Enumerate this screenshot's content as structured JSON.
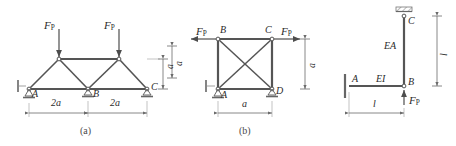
{
  "figure": {
    "caption_a": "(a)",
    "caption_b": "(b)",
    "line_color": "#4d4d4d",
    "member_color": "#555555",
    "dim_color": "#6b6b6b",
    "text_color": "#2b2b2b"
  },
  "fig_a": {
    "name": "two-panel-warren-truss",
    "loads": [
      {
        "label": "F",
        "sub": "P",
        "direction": "down",
        "at": "top-left-node"
      },
      {
        "label": "F",
        "sub": "P",
        "direction": "down",
        "at": "top-right-node"
      }
    ],
    "joints": [
      {
        "id": "A",
        "label": "A",
        "support": "pin"
      },
      {
        "id": "B",
        "label": "B",
        "support": "roller"
      },
      {
        "id": "C",
        "label": "C",
        "support": "roller"
      }
    ],
    "dimensions": [
      {
        "label": "2a",
        "orientation": "horizontal",
        "span": "A-B"
      },
      {
        "label": "2a",
        "orientation": "horizontal",
        "span": "B-C"
      },
      {
        "label": "a",
        "orientation": "vertical",
        "span": "height"
      }
    ]
  },
  "fig_b": {
    "name": "square-truss-with-cross-bracing",
    "loads": [
      {
        "label": "F",
        "sub": "P",
        "direction": "left",
        "at": "B"
      },
      {
        "label": "F",
        "sub": "P",
        "direction": "right",
        "at": "C"
      }
    ],
    "joints": [
      {
        "id": "B",
        "label": "B",
        "support": "none"
      },
      {
        "id": "C",
        "label": "C",
        "support": "none"
      },
      {
        "id": "A",
        "label": "A",
        "support": "pin"
      },
      {
        "id": "D",
        "label": "D",
        "support": "roller"
      }
    ],
    "dimensions": [
      {
        "label": "a",
        "orientation": "horizontal",
        "span": "A-D"
      },
      {
        "label": "a",
        "orientation": "vertical",
        "span": "A-B"
      }
    ]
  },
  "fig_c": {
    "name": "l-shaped-frame",
    "loads": [
      {
        "label": "F",
        "sub": "P",
        "direction": "up",
        "at": "B"
      }
    ],
    "joints": [
      {
        "id": "A",
        "label": "A",
        "support": "fixed"
      },
      {
        "id": "B",
        "label": "B",
        "support": "none"
      },
      {
        "id": "C",
        "label": "C",
        "support": "pin-top"
      }
    ],
    "members": [
      {
        "label": "EI",
        "orientation": "horizontal",
        "span": "A-B"
      },
      {
        "label": "EA",
        "orientation": "vertical",
        "span": "B-C"
      }
    ],
    "dimensions": [
      {
        "label": "l",
        "orientation": "horizontal",
        "span": "A-B"
      },
      {
        "label": "l",
        "orientation": "vertical",
        "span": "B-C"
      }
    ]
  }
}
